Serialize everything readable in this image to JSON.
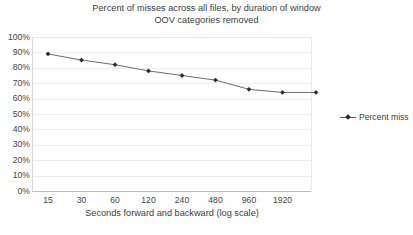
{
  "chart_data": {
    "type": "line",
    "title": "Percent of misses across all files, by duration of window",
    "subtitle": "OOV categories removed",
    "xlabel": "Seconds forward and backward (log scale)",
    "ylabel": "",
    "categories": [
      "15",
      "30",
      "60",
      "120",
      "240",
      "480",
      "960",
      "1920",
      ""
    ],
    "x_tick_labels": [
      "15",
      "30",
      "60",
      "120",
      "240",
      "480",
      "960",
      "1920"
    ],
    "series": [
      {
        "name": "Percent miss",
        "values": [
          89,
          85,
          82,
          78,
          75,
          72,
          66,
          64,
          64
        ],
        "color": "#2b2b38"
      }
    ],
    "ylim": [
      0,
      100
    ],
    "y_tick_labels": [
      "100%",
      "90%",
      "80%",
      "70%",
      "60%",
      "50%",
      "40%",
      "30%",
      "20%",
      "10%",
      "0%"
    ],
    "y_tick_values": [
      100,
      90,
      80,
      70,
      60,
      50,
      40,
      30,
      20,
      10,
      0
    ],
    "grid": true,
    "grid_axis": "y",
    "legend_position": "right",
    "legend_entries": [
      "Percent miss"
    ],
    "marker": "diamond",
    "line_color": "#6b6b7a",
    "marker_color": "#2b2b38",
    "gridline_color": "#eeeeee",
    "axis_color": "#bdbdbd",
    "background": "#ffffff",
    "text_color": "#3c3c3c"
  }
}
